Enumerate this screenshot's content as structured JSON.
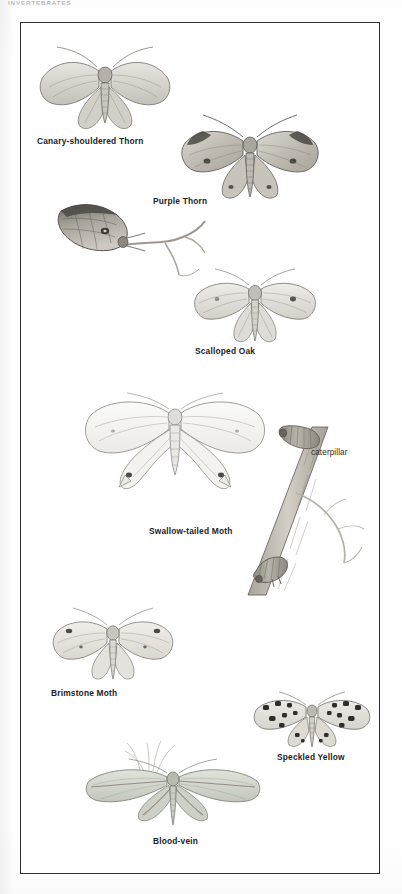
{
  "running_head": "INVERTEBRATES",
  "plate": {
    "frame_color": "#2e2e2e",
    "background": "#ffffff",
    "figures": [
      {
        "id": "canary-shouldered-thorn",
        "caption": "Canary-shouldered Thorn",
        "caption_style": "bold",
        "caption_x": 36,
        "caption_y": 140,
        "art_x": 34,
        "art_y": 40,
        "art_w": 140,
        "art_h": 95,
        "pose": "wings-spread-forward",
        "body_tone": "#d8d6d0",
        "wing_tone": "#cfcdc7"
      },
      {
        "id": "purple-thorn",
        "caption": "Purple Thorn",
        "caption_style": "bold",
        "caption_x": 152,
        "caption_y": 200,
        "art_x": 176,
        "art_y": 112,
        "art_w": 145,
        "art_h": 90,
        "pose": "wings-spread",
        "body_tone": "#cfccc5",
        "wing_tone": "#c4c1ba"
      },
      {
        "id": "early-thorn-resting",
        "caption": "",
        "caption_style": "none",
        "caption_x": 0,
        "caption_y": 0,
        "art_x": 52,
        "art_y": 192,
        "art_w": 150,
        "art_h": 95,
        "pose": "resting-on-twig",
        "body_tone": "#b9b4ac",
        "wing_tone": "#a9a49c"
      },
      {
        "id": "scalloped-oak",
        "caption": "Scalloped Oak",
        "caption_style": "bold",
        "caption_x": 194,
        "caption_y": 350,
        "art_x": 190,
        "art_y": 262,
        "art_w": 130,
        "art_h": 85,
        "pose": "wings-spread",
        "body_tone": "#dcdad4",
        "wing_tone": "#d4d2cc"
      },
      {
        "id": "swallow-tailed-moth",
        "caption": "Swallow-tailed Moth",
        "caption_style": "bold",
        "caption_x": 148,
        "caption_y": 530,
        "art_x": 80,
        "art_y": 382,
        "art_w": 185,
        "art_h": 130,
        "pose": "wings-spread-pale",
        "body_tone": "#f2f1ee",
        "wing_tone": "#ededea"
      },
      {
        "id": "swallow-tailed-moth-caterpillar",
        "caption": "caterpillar",
        "caption_style": "light",
        "caption_x": 310,
        "caption_y": 452,
        "art_x": 225,
        "art_y": 420,
        "art_w": 110,
        "art_h": 165,
        "pose": "twig-mimic-on-branch",
        "body_tone": "#b5afa6",
        "wing_tone": "#cfcac2"
      },
      {
        "id": "brimstone-moth",
        "caption": "Brimstone Moth",
        "caption_style": "bold",
        "caption_x": 50,
        "caption_y": 692,
        "art_x": 46,
        "art_y": 602,
        "art_w": 130,
        "art_h": 82,
        "pose": "wings-spread",
        "body_tone": "#e2e0d9",
        "wing_tone": "#dcdad3"
      },
      {
        "id": "speckled-yellow",
        "caption": "Speckled Yellow",
        "caption_style": "bold",
        "caption_x": 276,
        "caption_y": 756,
        "art_x": 248,
        "art_y": 688,
        "art_w": 125,
        "art_h": 62,
        "pose": "wings-spread-spotted",
        "body_tone": "#dddbd4",
        "wing_tone": "#d6d4cd"
      },
      {
        "id": "blood-vein",
        "caption": "Blood-vein",
        "caption_style": "bold",
        "caption_x": 152,
        "caption_y": 840,
        "art_x": 82,
        "art_y": 740,
        "art_w": 175,
        "art_h": 95,
        "pose": "wings-spread-wide",
        "body_tone": "#cfd2c9",
        "wing_tone": "#c8cbc2"
      }
    ]
  }
}
